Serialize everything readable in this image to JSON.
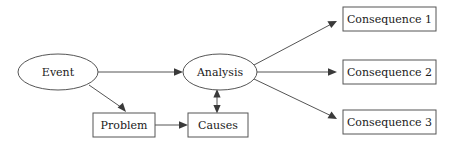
{
  "diagram": {
    "background_color": "#ffffff",
    "shape_stroke_color": "#555555",
    "shape_fill_color": "#ffffff",
    "text_color": "#1a1a1a",
    "arrow_color": "#3a3a3a",
    "nodes": {
      "event": {
        "label": "Event",
        "shape": "ellipse",
        "cx": 58,
        "cy": 72,
        "rx": 40,
        "ry": 18,
        "font_size": 11
      },
      "analysis": {
        "label": "Analysis",
        "shape": "ellipse",
        "cx": 220,
        "cy": 72,
        "rx": 37,
        "ry": 18,
        "font_size": 11
      },
      "problem": {
        "label": "Problem",
        "shape": "rect",
        "x": 93,
        "y": 113,
        "width": 62,
        "height": 24,
        "font_size": 11
      },
      "causes": {
        "label": "Causes",
        "shape": "rect",
        "x": 188,
        "y": 113,
        "width": 60,
        "height": 24,
        "font_size": 11
      },
      "consequence1": {
        "label": "Consequence 1",
        "shape": "rect",
        "x": 343,
        "y": 7,
        "width": 93,
        "height": 24,
        "font_size": 11
      },
      "consequence2": {
        "label": "Consequence 2",
        "shape": "rect",
        "x": 343,
        "y": 60,
        "width": 93,
        "height": 24,
        "font_size": 11
      },
      "consequence3": {
        "label": "Consequence 3",
        "shape": "rect",
        "x": 343,
        "y": 110,
        "width": 93,
        "height": 24,
        "font_size": 11
      }
    },
    "edges": [
      {
        "name": "event-to-analysis",
        "from": "event",
        "to": "analysis",
        "direction": "forward"
      },
      {
        "name": "event-to-problem",
        "from": "event",
        "to": "problem",
        "direction": "forward"
      },
      {
        "name": "problem-to-causes",
        "from": "problem",
        "to": "causes",
        "direction": "forward"
      },
      {
        "name": "analysis-causes",
        "from": "analysis",
        "to": "causes",
        "direction": "bidirectional"
      },
      {
        "name": "analysis-to-consequence1",
        "from": "analysis",
        "to": "consequence1",
        "direction": "forward"
      },
      {
        "name": "analysis-to-consequence2",
        "from": "analysis",
        "to": "consequence2",
        "direction": "forward"
      },
      {
        "name": "analysis-to-consequence3",
        "from": "analysis",
        "to": "consequence3",
        "direction": "forward"
      }
    ]
  }
}
